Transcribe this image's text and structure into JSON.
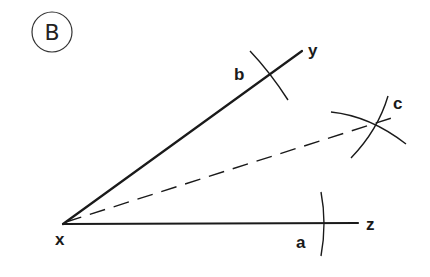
{
  "figure": {
    "badge": {
      "label": "B",
      "cx": 52,
      "cy": 32,
      "r": 20
    },
    "stroke_color": "#1a1a1a",
    "points": {
      "x": {
        "label": "x",
        "pos": [
          63,
          224
        ],
        "label_pos": [
          55,
          245
        ]
      },
      "y": {
        "label": "y",
        "pos": [
          302,
          51
        ],
        "label_pos": [
          308,
          56
        ]
      },
      "z": {
        "label": "z",
        "pos": [
          358,
          223
        ],
        "label_pos": [
          366,
          230
        ]
      },
      "a": {
        "label": "a",
        "pos": [
          322,
          223
        ],
        "label_pos": [
          296,
          248
        ]
      },
      "b": {
        "label": "b",
        "pos": [
          270,
          74
        ],
        "label_pos": [
          234,
          80
        ]
      },
      "c": {
        "label": "c",
        "pos": [
          378,
          123
        ],
        "label_pos": [
          393,
          109
        ]
      }
    },
    "lines": [
      {
        "name": "ray-xy",
        "from": "x",
        "to": "y",
        "style": "solid"
      },
      {
        "name": "ray-xz",
        "from": "x",
        "to": "z",
        "style": "solid"
      },
      {
        "name": "bisector-xc",
        "from": "x",
        "to": "c",
        "style": "dashed"
      }
    ],
    "arcs": [
      {
        "name": "arc-a",
        "description": "arc marking point a on xz"
      },
      {
        "name": "arc-b",
        "description": "arc marking point b on xy"
      },
      {
        "name": "arc-c-from-a",
        "description": "arc from a intersecting at c"
      },
      {
        "name": "arc-c-from-b",
        "description": "arc from b intersecting at c"
      }
    ]
  }
}
